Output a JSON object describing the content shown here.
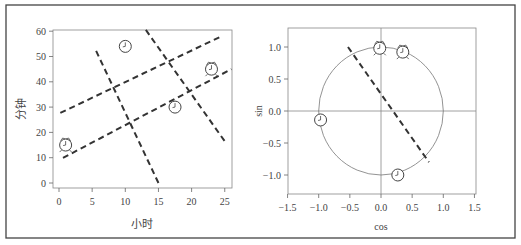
{
  "chart_data": [
    {
      "type": "scatter",
      "title": "",
      "xlabel": "小时",
      "ylabel": "分钟",
      "xlim": [
        -1,
        26
      ],
      "ylim": [
        -2,
        62
      ],
      "xticks": [
        0,
        5,
        10,
        15,
        20,
        25
      ],
      "yticks": [
        0,
        10,
        20,
        30,
        40,
        50,
        60
      ],
      "grid": false,
      "legend": null,
      "points": [
        {
          "x": 1,
          "y": 15,
          "marker": "alarm-clock"
        },
        {
          "x": 10,
          "y": 54,
          "marker": "clock"
        },
        {
          "x": 17.5,
          "y": 30,
          "marker": "clock"
        },
        {
          "x": 23,
          "y": 45,
          "marker": "alarm-clock"
        }
      ],
      "lines": [
        {
          "style": "dashed",
          "from": [
            0.2,
            27.7
          ],
          "to": [
            24.6,
            58.1
          ]
        },
        {
          "style": "dashed",
          "from": [
            0.6,
            9.9
          ],
          "to": [
            26,
            45
          ]
        },
        {
          "style": "dashed",
          "from": [
            5.6,
            52.2
          ],
          "to": [
            15,
            0
          ]
        },
        {
          "style": "dashed",
          "from": [
            13.1,
            60.5
          ],
          "to": [
            25.3,
            15.4
          ]
        }
      ]
    },
    {
      "type": "scatter",
      "title": "",
      "xlabel": "cos",
      "ylabel": "sin",
      "xlim": [
        -1.5,
        1.5
      ],
      "ylim": [
        -1.3,
        1.3
      ],
      "xticks": [
        -1.5,
        -1.0,
        -0.5,
        0.0,
        0.5,
        1.0,
        1.5
      ],
      "yticks": [
        -1.0,
        -0.5,
        0.0,
        0.5,
        1.0
      ],
      "grid": false,
      "legend": null,
      "reference_lines": [
        "x=0",
        "y=0"
      ],
      "unit_circle": true,
      "points": [
        {
          "x": -0.02,
          "y": 0.98,
          "marker": "alarm-clock"
        },
        {
          "x": 0.35,
          "y": 0.92,
          "marker": "alarm-clock"
        },
        {
          "x": -0.97,
          "y": -0.14,
          "marker": "clock"
        },
        {
          "x": 0.27,
          "y": -1.0,
          "marker": "clock"
        }
      ],
      "lines": [
        {
          "style": "dashed",
          "from": [
            -0.53,
            1.0
          ],
          "to": [
            0.77,
            -0.8
          ]
        }
      ]
    }
  ],
  "left": {
    "xlabel": "小时",
    "ylabel": "分钟",
    "xtick_labels": [
      "0",
      "5",
      "10",
      "15",
      "20",
      "25"
    ],
    "ytick_labels": [
      "0",
      "10",
      "20",
      "30",
      "40",
      "50",
      "60"
    ]
  },
  "right": {
    "xlabel": "cos",
    "ylabel": "sin",
    "xtick_labels": [
      "−1.5",
      "−1.0",
      "−0.5",
      "0.0",
      "0.5",
      "1.0",
      "1.5"
    ],
    "ytick_labels": [
      "−1.0",
      "−0.5",
      "0.0",
      "0.5",
      "1.0"
    ]
  },
  "colors": {
    "axis": "#555555",
    "dashed": "#333333",
    "circle": "#777777",
    "border": "#444444"
  }
}
